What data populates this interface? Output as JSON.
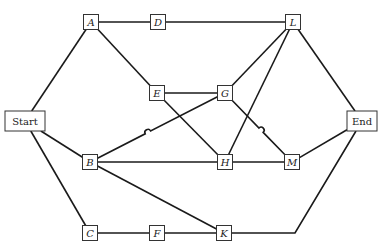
{
  "diagram": {
    "type": "network-precedence-graph",
    "nodes": [
      {
        "id": "Start",
        "label": "Start",
        "x": 25,
        "y": 121,
        "w": 40,
        "h": 20,
        "italic": false
      },
      {
        "id": "A",
        "label": "A",
        "x": 91,
        "y": 22,
        "w": 15,
        "h": 15,
        "italic": true
      },
      {
        "id": "D",
        "label": "D",
        "x": 158,
        "y": 22,
        "w": 15,
        "h": 15,
        "italic": true
      },
      {
        "id": "L",
        "label": "L",
        "x": 293,
        "y": 22,
        "w": 15,
        "h": 15,
        "italic": true
      },
      {
        "id": "E",
        "label": "E",
        "x": 157,
        "y": 93,
        "w": 15,
        "h": 15,
        "italic": true
      },
      {
        "id": "G",
        "label": "G",
        "x": 225,
        "y": 93,
        "w": 15,
        "h": 15,
        "italic": true
      },
      {
        "id": "B",
        "label": "B",
        "x": 90,
        "y": 162,
        "w": 15,
        "h": 15,
        "italic": true
      },
      {
        "id": "H",
        "label": "H",
        "x": 225,
        "y": 162,
        "w": 15,
        "h": 15,
        "italic": true
      },
      {
        "id": "M",
        "label": "M",
        "x": 292,
        "y": 162,
        "w": 15,
        "h": 15,
        "italic": true
      },
      {
        "id": "C",
        "label": "C",
        "x": 90,
        "y": 233,
        "w": 15,
        "h": 15,
        "italic": true
      },
      {
        "id": "F",
        "label": "F",
        "x": 157,
        "y": 233,
        "w": 15,
        "h": 15,
        "italic": true
      },
      {
        "id": "K",
        "label": "K",
        "x": 224,
        "y": 233,
        "w": 15,
        "h": 15,
        "italic": true
      },
      {
        "id": "End",
        "label": "End",
        "x": 362,
        "y": 121,
        "w": 30,
        "h": 20,
        "italic": false
      }
    ],
    "edges": [
      {
        "from": "Start",
        "to": "A"
      },
      {
        "from": "Start",
        "to": "B"
      },
      {
        "from": "Start",
        "to": "C"
      },
      {
        "from": "A",
        "to": "D"
      },
      {
        "from": "D",
        "to": "L"
      },
      {
        "from": "A",
        "to": "E"
      },
      {
        "from": "E",
        "to": "G"
      },
      {
        "from": "E",
        "to": "H"
      },
      {
        "from": "B",
        "to": "G",
        "hop": true
      },
      {
        "from": "B",
        "to": "H"
      },
      {
        "from": "B",
        "to": "K"
      },
      {
        "from": "G",
        "to": "L"
      },
      {
        "from": "G",
        "to": "M",
        "hop": true
      },
      {
        "from": "H",
        "to": "L"
      },
      {
        "from": "H",
        "to": "M"
      },
      {
        "from": "L",
        "to": "End"
      },
      {
        "from": "M",
        "to": "End"
      },
      {
        "from": "C",
        "to": "F"
      },
      {
        "from": "F",
        "to": "K"
      },
      {
        "from": "K",
        "to": "End",
        "via": [
          [
            295,
            233
          ]
        ]
      }
    ]
  }
}
